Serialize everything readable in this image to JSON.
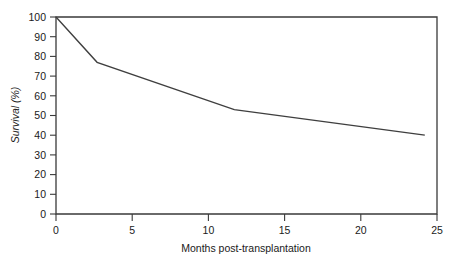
{
  "chart_data": {
    "type": "line",
    "title": "",
    "subtitle": "",
    "xlabel": "Months post-transplantation",
    "ylabel": "Survival (%)",
    "xlim": [
      0,
      25
    ],
    "ylim": [
      0,
      100
    ],
    "xticks": [
      0,
      5,
      10,
      15,
      20,
      25
    ],
    "xtick_labels": [
      "0",
      "5",
      "10",
      "15",
      "20",
      "25"
    ],
    "yticks": [
      0,
      10,
      20,
      30,
      40,
      50,
      60,
      70,
      80,
      90,
      100
    ],
    "ytick_labels": [
      "0",
      "10",
      "20",
      "30",
      "40",
      "50",
      "60",
      "70",
      "80",
      "90",
      "100"
    ],
    "grid": false,
    "legend": false,
    "legend_position": "none",
    "frame": "box",
    "series": [
      {
        "name": "Survival",
        "x": [
          0,
          2.7,
          11.7,
          24.2
        ],
        "values": [
          100,
          77,
          53,
          40
        ]
      }
    ]
  },
  "axes": {
    "y_title": "Survival (%)",
    "x_title": "Months post-transplantation"
  }
}
